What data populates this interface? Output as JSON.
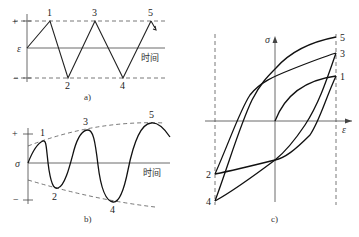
{
  "panel_a": {
    "caption": "a)",
    "y_label": "ε",
    "x_label": "时间",
    "plus": "+",
    "minus": "−",
    "points": [
      "1",
      "2",
      "3",
      "4",
      "5"
    ]
  },
  "panel_b": {
    "caption": "b)",
    "y_label": "σ",
    "x_label": "时间",
    "plus": "+",
    "minus": "−",
    "points": [
      "1",
      "2",
      "3",
      "4",
      "5"
    ]
  },
  "panel_c": {
    "caption": "c)",
    "y_label": "σ",
    "x_label": "ε",
    "points_right": [
      "5",
      "3",
      "1"
    ],
    "points_left": [
      "2",
      "4"
    ]
  }
}
